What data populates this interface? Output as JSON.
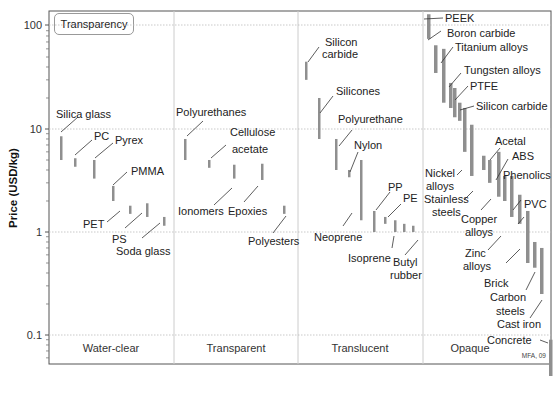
{
  "chart_data": {
    "type": "bar",
    "subtype": "range-bar (log scale, grouped by transparency class)",
    "title": "",
    "legend_label": "Transparency",
    "xlabel": "",
    "ylabel": "Price (USD/kg)",
    "yscale": "log",
    "ylim": [
      0.04,
      140
    ],
    "yticks": [
      {
        "value": 0.1,
        "label": "0.1"
      },
      {
        "value": 1,
        "label": "1"
      },
      {
        "value": 10,
        "label": "10"
      },
      {
        "value": 100,
        "label": "100"
      }
    ],
    "grid": true,
    "categories": [
      "Water-clear",
      "Transparent",
      "Translucent",
      "Opaque"
    ],
    "credit": "MFA, 09",
    "series": [
      {
        "category": "Water-clear",
        "name": "Silica glass",
        "low": 5,
        "high": 8.5
      },
      {
        "category": "Water-clear",
        "name": "PC",
        "low": 4.3,
        "high": 5.2
      },
      {
        "category": "Water-clear",
        "name": "Pyrex",
        "low": 3.3,
        "high": 5
      },
      {
        "category": "Water-clear",
        "name": "PMMA",
        "low": 2,
        "high": 2.8
      },
      {
        "category": "Water-clear",
        "name": "PET",
        "low": 1.5,
        "high": 1.8
      },
      {
        "category": "Water-clear",
        "name": "PS",
        "low": 1.4,
        "high": 1.9
      },
      {
        "category": "Water-clear",
        "name": "Soda glass",
        "low": 1.15,
        "high": 1.4
      },
      {
        "category": "Transparent",
        "name": "Polyurethanes",
        "low": 5,
        "high": 8
      },
      {
        "category": "Transparent",
        "name": "Cellulose acetate",
        "low": 4.2,
        "high": 5
      },
      {
        "category": "Transparent",
        "name": "Ionomers",
        "low": 3.3,
        "high": 4.5
      },
      {
        "category": "Transparent",
        "name": "Epoxies",
        "low": 3.2,
        "high": 4.6
      },
      {
        "category": "Transparent",
        "name": "Polyesters",
        "low": 1.5,
        "high": 1.8
      },
      {
        "category": "Translucent",
        "name": "Silicon carbide",
        "low": 30,
        "high": 45
      },
      {
        "category": "Translucent",
        "name": "Silicones",
        "low": 8,
        "high": 20
      },
      {
        "category": "Translucent",
        "name": "Polyurethane",
        "low": 4,
        "high": 8
      },
      {
        "category": "Translucent",
        "name": "Nylon",
        "low": 3.4,
        "high": 4
      },
      {
        "category": "Translucent",
        "name": "Neoprene",
        "low": 1.3,
        "high": 5
      },
      {
        "category": "Translucent",
        "name": "PP",
        "low": 1,
        "high": 1.6
      },
      {
        "category": "Translucent",
        "name": "PE",
        "low": 1.2,
        "high": 1.4
      },
      {
        "category": "Translucent",
        "name": "Isoprene",
        "low": 1,
        "high": 1.3
      },
      {
        "category": "Translucent",
        "name": "Butyl rubber",
        "low": 1,
        "high": 1.2
      },
      {
        "category": "Translucent",
        "name": "unlabeled",
        "low": 1,
        "high": 1.15
      },
      {
        "category": "Opaque",
        "name": "PEEK",
        "low": 75,
        "high": 130
      },
      {
        "category": "Opaque",
        "name": "Boron carbide",
        "low": 35,
        "high": 65
      },
      {
        "category": "Opaque",
        "name": "Titanium alloys",
        "low": 18,
        "high": 60
      },
      {
        "category": "Opaque",
        "name": "Tungsten alloys",
        "low": 16,
        "high": 28
      },
      {
        "category": "Opaque",
        "name": "PTFE",
        "low": 13,
        "high": 25
      },
      {
        "category": "Opaque",
        "name": "Silicon carbide",
        "low": 12,
        "high": 18
      },
      {
        "category": "Opaque",
        "name": "Nickel alloys",
        "low": 6,
        "high": 16
      },
      {
        "category": "Opaque",
        "name": "Stainless steels",
        "low": 3.5,
        "high": 11
      },
      {
        "category": "Opaque",
        "name": "Acetal",
        "low": 4,
        "high": 5.5
      },
      {
        "category": "Opaque",
        "name": "ABS",
        "low": 3,
        "high": 5
      },
      {
        "category": "Opaque",
        "name": "Copper alloys",
        "low": 2.2,
        "high": 6
      },
      {
        "category": "Opaque",
        "name": "Phenolics",
        "low": 2,
        "high": 3.5
      },
      {
        "category": "Opaque",
        "name": "Zinc alloys",
        "low": 1.4,
        "high": 3.5
      },
      {
        "category": "Opaque",
        "name": "PVC",
        "low": 1.2,
        "high": 2.3
      },
      {
        "category": "Opaque",
        "name": "Brick",
        "low": 0.5,
        "high": 1.6
      },
      {
        "category": "Opaque",
        "name": "Carbon steels",
        "low": 0.45,
        "high": 0.8
      },
      {
        "category": "Opaque",
        "name": "Cast iron",
        "low": 0.25,
        "high": 0.7
      },
      {
        "category": "Opaque",
        "name": "Concrete",
        "low": 0.04,
        "high": 0.09
      }
    ]
  },
  "labels": {
    "legend": "Transparency",
    "ylabel": "Price (USD/kg)",
    "credit": "MFA, 09",
    "categories": [
      "Water-clear",
      "Transparent",
      "Translucent",
      "Opaque"
    ],
    "ticks": [
      "0.1",
      "1",
      "10",
      "100"
    ]
  }
}
